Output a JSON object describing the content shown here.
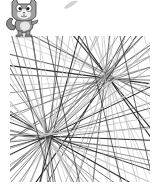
{
  "stage": {
    "background": "#ffffff",
    "width": 157,
    "height": 194
  },
  "sprite": {
    "icon": "cat-sprite-icon",
    "tone": "grayscale",
    "position": {
      "x": 4,
      "y": 0
    }
  },
  "smudge": {
    "icon": "smudge-mark",
    "position": {
      "x": 62,
      "y": 0
    }
  },
  "line_art": {
    "region": {
      "x0": 10,
      "y0": 36,
      "x1": 150,
      "y1": 182
    },
    "focal_points": [
      {
        "name": "upper-right",
        "x": 107,
        "y": 78
      },
      {
        "name": "lower-left",
        "x": 48,
        "y": 137
      }
    ],
    "colors": {
      "dark": "#2a2a2a",
      "mid": "#777777",
      "light": "#c8c8c8"
    }
  }
}
